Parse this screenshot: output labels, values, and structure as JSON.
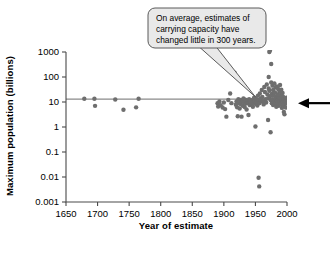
{
  "chart_data": {
    "type": "scatter",
    "title": "",
    "xlabel": "Year of estimate",
    "ylabel": "Maximum population (billions)",
    "xlim": [
      1650,
      2000
    ],
    "ylim": [
      0.001,
      1000
    ],
    "yscale": "log",
    "xticks": [
      1650,
      1700,
      1750,
      1800,
      1850,
      1900,
      1950,
      2000
    ],
    "xticklabels": [
      "1650",
      "1700",
      "1750",
      "1800",
      "1850",
      "1900",
      "1950",
      "2000"
    ],
    "yticks": [
      0.001,
      0.01,
      0.1,
      1,
      10,
      100,
      1000
    ],
    "yticklabels": [
      "0.001",
      "0.01",
      "0.1",
      "1",
      "10",
      "100",
      "1000"
    ],
    "grid": false,
    "legend": null,
    "point_color": "#6e6e6e",
    "point_size": 4.4,
    "reference_line": {
      "orientation": "horizontal",
      "value": 13,
      "label": "",
      "color": "#8a8a8a",
      "x_from": 1650,
      "x_to": 2000
    },
    "series": [
      {
        "name": "Estimates of carrying capacity",
        "points": [
          [
            1679,
            13.4
          ],
          [
            1695,
            13.4
          ],
          [
            1696,
            7.0
          ],
          [
            1728,
            12.6
          ],
          [
            1741,
            4.9
          ],
          [
            1761,
            6.1
          ],
          [
            1765,
            13.4
          ],
          [
            1890,
            9.0
          ],
          [
            1891,
            6.6
          ],
          [
            1893,
            10.5
          ],
          [
            1895,
            7.4
          ],
          [
            1898,
            6.0
          ],
          [
            1900,
            9.5
          ],
          [
            1902,
            5.2
          ],
          [
            1904,
            2.6
          ],
          [
            1907,
            12.0
          ],
          [
            1910,
            22.0
          ],
          [
            1912,
            9.0
          ],
          [
            1917,
            150.0
          ],
          [
            1919,
            7.8
          ],
          [
            1920,
            10.5
          ],
          [
            1921,
            6.2
          ],
          [
            1922,
            2.7
          ],
          [
            1923,
            13.0
          ],
          [
            1924,
            9.0
          ],
          [
            1925,
            5.5
          ],
          [
            1926,
            12.0
          ],
          [
            1927,
            8.2
          ],
          [
            1928,
            2.6
          ],
          [
            1929,
            11.0
          ],
          [
            1930,
            7.0
          ],
          [
            1931,
            14.0
          ],
          [
            1932,
            9.5
          ],
          [
            1933,
            6.3
          ],
          [
            1934,
            12.5
          ],
          [
            1935,
            8.8
          ],
          [
            1936,
            5.0
          ],
          [
            1937,
            11.5
          ],
          [
            1938,
            9.0
          ],
          [
            1939,
            3.0
          ],
          [
            1940,
            13.0
          ],
          [
            1941,
            7.5
          ],
          [
            1942,
            10.0
          ],
          [
            1944,
            8.0
          ],
          [
            1945,
            12.0
          ],
          [
            1946,
            6.5
          ],
          [
            1947,
            9.5
          ],
          [
            1948,
            15.0
          ],
          [
            1949,
            11.0
          ],
          [
            1950,
            8.5
          ],
          [
            1950,
            1.05
          ],
          [
            1951,
            13.5
          ],
          [
            1952,
            10.0
          ],
          [
            1953,
            7.2
          ],
          [
            1954,
            18.0
          ],
          [
            1955,
            12.0
          ],
          [
            1955,
            0.0093
          ],
          [
            1956,
            0.0042
          ],
          [
            1956,
            9.0
          ],
          [
            1957,
            22.0
          ],
          [
            1958,
            14.0
          ],
          [
            1959,
            10.5
          ],
          [
            1960,
            30.0
          ],
          [
            1961,
            16.0
          ],
          [
            1962,
            11.0
          ],
          [
            1963,
            8.0
          ],
          [
            1964,
            40.0
          ],
          [
            1965,
            25.0
          ],
          [
            1966,
            13.0
          ],
          [
            1967,
            9.5
          ],
          [
            1968,
            50.0
          ],
          [
            1969,
            20.0
          ],
          [
            1970,
            14.0
          ],
          [
            1970,
            1.9
          ],
          [
            1971,
            35.0
          ],
          [
            1971,
            100.0
          ],
          [
            1972,
            28.0
          ],
          [
            1972,
            1000.0
          ],
          [
            1973,
            17.0
          ],
          [
            1973,
            1150.0
          ],
          [
            1974,
            12.0
          ],
          [
            1974,
            0.62
          ],
          [
            1975,
            60.0
          ],
          [
            1975,
            330.0
          ],
          [
            1976,
            21.0
          ],
          [
            1976,
            9.0
          ],
          [
            1977,
            45.0
          ],
          [
            1977,
            13.0
          ],
          [
            1978,
            30.0
          ],
          [
            1978,
            7.5
          ],
          [
            1979,
            18.0
          ],
          [
            1979,
            10.0
          ],
          [
            1980,
            55.0
          ],
          [
            1980,
            12.0
          ],
          [
            1981,
            24.0
          ],
          [
            1981,
            8.5
          ],
          [
            1982,
            38.0
          ],
          [
            1982,
            14.0
          ],
          [
            1983,
            16.0
          ],
          [
            1983,
            6.5
          ],
          [
            1984,
            42.0
          ],
          [
            1984,
            11.0
          ],
          [
            1985,
            20.0
          ],
          [
            1985,
            9.0
          ],
          [
            1986,
            33.0
          ],
          [
            1986,
            13.0
          ],
          [
            1987,
            15.0
          ],
          [
            1987,
            7.0
          ],
          [
            1988,
            26.0
          ],
          [
            1988,
            10.5
          ],
          [
            1989,
            48.0
          ],
          [
            1989,
            12.0
          ],
          [
            1990,
            19.0
          ],
          [
            1990,
            8.0
          ],
          [
            1991,
            31.0
          ],
          [
            1991,
            14.0
          ],
          [
            1992,
            11.0
          ],
          [
            1992,
            5.8
          ],
          [
            1993,
            23.0
          ],
          [
            1993,
            9.5
          ],
          [
            1994,
            16.0
          ],
          [
            1994,
            7.2
          ],
          [
            1995,
            12.5
          ],
          [
            1995,
            4.0
          ],
          [
            1996,
            10.0
          ],
          [
            1996,
            3.2
          ],
          [
            1997,
            8.5
          ],
          [
            1997,
            13.0
          ],
          [
            1998,
            11.0
          ],
          [
            1998,
            6.0
          ],
          [
            1999,
            9.0
          ],
          [
            1999,
            15.0
          ]
        ]
      }
    ],
    "annotations": [
      {
        "name": "callout",
        "text": "On average, estimates of carrying capacity have changed little in 300 years.",
        "lines": [
          "On average, estimates of",
          "carrying capacity have",
          "changed little in 300 years."
        ],
        "points_to": [
          1950,
          16
        ],
        "fill": "#e9e9e9",
        "stroke": "#5a5a5a"
      },
      {
        "name": "pointer-arrow",
        "text": "",
        "points_to": [
          2000,
          9
        ],
        "color": "#000000"
      }
    ]
  }
}
